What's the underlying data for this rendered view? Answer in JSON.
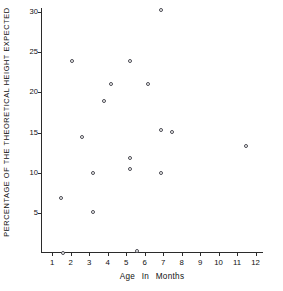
{
  "chart_data": {
    "type": "scatter",
    "title": "",
    "xlabel": "Age   In   Months",
    "ylabel": "PERCENTAGE OF THE THEORETICAL HEIGHT EXPECTED",
    "xlim": [
      0.4,
      12.4
    ],
    "ylim": [
      0,
      30.5
    ],
    "xticks": [
      1,
      2,
      3,
      4,
      5,
      6,
      7,
      8,
      9,
      10,
      11,
      12
    ],
    "xtick_labels": [
      "1",
      "2",
      "3",
      "4",
      "5",
      "6",
      "7",
      "8",
      "9",
      "10",
      "11",
      "12"
    ],
    "yticks": [
      5,
      10,
      15,
      20,
      25,
      30
    ],
    "ytick_labels": [
      "5",
      "10",
      "15",
      "20",
      "25",
      "30"
    ],
    "grid": false,
    "legend": false,
    "marker": "open-circle",
    "marker_color": "#4a4a52",
    "axis_color": "#2b2b2b",
    "background": "#ffffff",
    "points": [
      {
        "x": 6.9,
        "y": 30.3
      },
      {
        "x": 2.1,
        "y": 23.9
      },
      {
        "x": 5.2,
        "y": 23.9
      },
      {
        "x": 4.2,
        "y": 21.0
      },
      {
        "x": 6.2,
        "y": 21.0
      },
      {
        "x": 3.8,
        "y": 18.9
      },
      {
        "x": 6.9,
        "y": 15.3
      },
      {
        "x": 7.5,
        "y": 15.1
      },
      {
        "x": 2.6,
        "y": 14.5
      },
      {
        "x": 11.5,
        "y": 13.3
      },
      {
        "x": 5.2,
        "y": 11.8
      },
      {
        "x": 5.2,
        "y": 10.5
      },
      {
        "x": 3.2,
        "y": 10.0
      },
      {
        "x": 6.9,
        "y": 10.0
      },
      {
        "x": 1.5,
        "y": 6.9
      },
      {
        "x": 3.2,
        "y": 5.1
      },
      {
        "x": 5.6,
        "y": 0.2
      },
      {
        "x": 1.6,
        "y": 0.0
      }
    ]
  }
}
